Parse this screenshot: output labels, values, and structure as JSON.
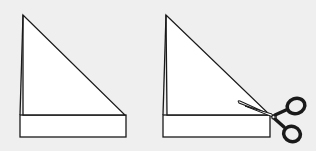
{
  "diagram": {
    "colors": {
      "background": "#efefef",
      "paper": "#ffffff",
      "stroke": "#1a1a1a"
    },
    "panels": [
      {
        "id": "step-1",
        "label": "folded-paper"
      },
      {
        "id": "step-2",
        "label": "cut-strip-with-scissors",
        "icon": "scissors-icon"
      }
    ]
  }
}
